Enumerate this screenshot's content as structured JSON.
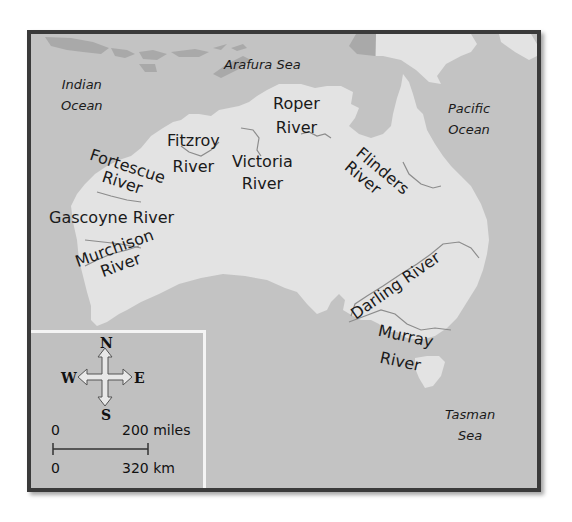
{
  "map": {
    "title": "Rivers of Australia",
    "colors": {
      "sea": "#c3c3c3",
      "land": "#e3e3e3",
      "neighbor_land": "#a9a9a9",
      "river_line": "#8c8c8c",
      "frame": "#3a3a3a",
      "legend_border": "#f4f4f4"
    },
    "water_bodies": [
      {
        "id": "indian-ocean",
        "lines": [
          "Indian",
          "Ocean"
        ]
      },
      {
        "id": "arafura-sea",
        "lines": [
          "Arafura Sea"
        ]
      },
      {
        "id": "pacific-ocean",
        "lines": [
          "Pacific",
          "Ocean"
        ]
      },
      {
        "id": "tasman-sea",
        "lines": [
          "Tasman",
          "Sea"
        ]
      }
    ],
    "rivers": [
      {
        "id": "roper-river",
        "lines": [
          "Roper",
          "River"
        ]
      },
      {
        "id": "fitzroy-river",
        "lines": [
          "Fitzroy",
          "River"
        ]
      },
      {
        "id": "victoria-river",
        "lines": [
          "Victoria",
          "River"
        ]
      },
      {
        "id": "flinders-river",
        "lines": [
          "Flinders",
          "River"
        ]
      },
      {
        "id": "fortescue-river",
        "lines": [
          "Fortescue",
          "River"
        ]
      },
      {
        "id": "gascoyne-river",
        "lines": [
          "Gascoyne River"
        ]
      },
      {
        "id": "murchison-river",
        "lines": [
          "Murchison",
          "River"
        ]
      },
      {
        "id": "darling-river",
        "lines": [
          "Darling River"
        ]
      },
      {
        "id": "murray-river",
        "lines": [
          "Murray",
          "River"
        ]
      }
    ]
  },
  "legend": {
    "compass": {
      "north": "N",
      "south": "S",
      "east": "E",
      "west": "W"
    },
    "scale": {
      "miles_start": "0",
      "miles_end": "200 miles",
      "km_start": "0",
      "km_end": "320 km"
    }
  }
}
